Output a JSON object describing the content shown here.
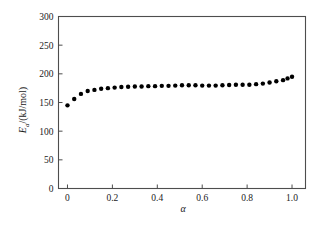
{
  "chart_data": {
    "type": "scatter",
    "title": "",
    "subtitle": "",
    "xlabel": "α",
    "ylabel": "E_a/(kJ/mol)",
    "ylabel_parts": {
      "symbol": "E",
      "subscript": "a",
      "units": "/(kJ/mol)"
    },
    "xlim": [
      -0.04,
      1.06
    ],
    "ylim": [
      0,
      300
    ],
    "xticks": [
      0,
      0.2,
      0.4,
      0.6,
      0.8,
      1.0
    ],
    "xtick_labels": [
      "0",
      "0.2",
      "0.4",
      "0.6",
      "0.8",
      "1.0"
    ],
    "yticks": [
      0,
      50,
      100,
      150,
      200,
      250,
      300
    ],
    "ytick_labels": [
      "0",
      "50",
      "100",
      "150",
      "200",
      "250",
      "300"
    ],
    "grid": false,
    "legend": null,
    "marker": {
      "shape": "circle",
      "color": "#000000",
      "size_px": 4.4
    },
    "series": [
      {
        "name": "Ea vs alpha",
        "x": [
          0.0,
          0.03,
          0.06,
          0.09,
          0.12,
          0.15,
          0.18,
          0.21,
          0.24,
          0.27,
          0.3,
          0.33,
          0.36,
          0.39,
          0.42,
          0.45,
          0.48,
          0.51,
          0.54,
          0.57,
          0.6,
          0.63,
          0.66,
          0.69,
          0.72,
          0.75,
          0.78,
          0.81,
          0.84,
          0.87,
          0.9,
          0.93,
          0.96,
          0.98,
          1.0
        ],
        "y": [
          145,
          156,
          165,
          170,
          172,
          174,
          175,
          176,
          177,
          177.5,
          178,
          178,
          178.5,
          178.5,
          179,
          179,
          179.5,
          180,
          180,
          180,
          179.5,
          179.5,
          179.5,
          180,
          180.5,
          181,
          181,
          181,
          182,
          183,
          185,
          187,
          189,
          192,
          195
        ]
      }
    ]
  },
  "axis_colors": {
    "frame": "#4d4d4d",
    "text": "#1a1a1a",
    "marker": "#000000"
  }
}
